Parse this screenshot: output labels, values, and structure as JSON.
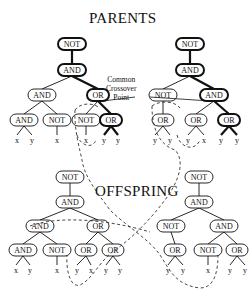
{
  "titles": {
    "parents": "PARENTS",
    "offspring": "OFFSPRING"
  },
  "callout": {
    "line1": "Common",
    "line2": "Crossover",
    "line3": "Point"
  },
  "trees": [
    {
      "name": "parent-left",
      "nodes": [
        {
          "id": "a",
          "label": "NOT",
          "bold": true
        },
        {
          "id": "b",
          "label": "AND",
          "bold": true,
          "parent": "a"
        },
        {
          "id": "c",
          "label": "AND",
          "parent": "b"
        },
        {
          "id": "d",
          "label": "OR",
          "bold": true,
          "parent": "b"
        },
        {
          "id": "e",
          "label": "AND",
          "parent": "c"
        },
        {
          "id": "f",
          "label": "NOT",
          "parent": "c"
        },
        {
          "id": "g",
          "label": "NOT",
          "parent": "d"
        },
        {
          "id": "h",
          "label": "OR",
          "bold": true,
          "parent": "d"
        }
      ],
      "leaves": [
        "x",
        "y",
        "x",
        "x",
        "y",
        "y"
      ]
    },
    {
      "name": "parent-right",
      "nodes": [
        {
          "id": "a",
          "label": "NOT",
          "bold": true
        },
        {
          "id": "b",
          "label": "AND",
          "bold": true,
          "parent": "a"
        },
        {
          "id": "c",
          "label": "NOT",
          "parent": "b"
        },
        {
          "id": "d",
          "label": "AND",
          "bold": true,
          "parent": "b"
        },
        {
          "id": "e",
          "label": "OR",
          "parent": "c"
        },
        {
          "id": "f",
          "label": "OR",
          "parent": "d"
        },
        {
          "id": "g",
          "label": "OR",
          "bold": true,
          "parent": "d"
        }
      ],
      "leaves": [
        "y",
        "y",
        "y",
        "x",
        "y",
        "y"
      ]
    },
    {
      "name": "offspring-left",
      "nodes": [
        {
          "id": "a",
          "label": "NOT"
        },
        {
          "id": "b",
          "label": "AND",
          "parent": "a"
        },
        {
          "id": "c",
          "label": "AND",
          "parent": "b"
        },
        {
          "id": "d",
          "label": "OR",
          "parent": "b"
        },
        {
          "id": "e",
          "label": "AND",
          "parent": "c"
        },
        {
          "id": "f",
          "label": "NOT",
          "parent": "c"
        },
        {
          "id": "g",
          "label": "OR",
          "parent": "d"
        },
        {
          "id": "h",
          "label": "OR",
          "parent": "d"
        }
      ],
      "leaves": [
        "x",
        "y",
        "x",
        "y",
        "x",
        "y",
        "y"
      ]
    },
    {
      "name": "offspring-right",
      "nodes": [
        {
          "id": "a",
          "label": "NOT"
        },
        {
          "id": "b",
          "label": "AND",
          "parent": "a"
        },
        {
          "id": "c",
          "label": "NOT",
          "parent": "b"
        },
        {
          "id": "d",
          "label": "AND",
          "parent": "b"
        },
        {
          "id": "e",
          "label": "OR",
          "parent": "c"
        },
        {
          "id": "f",
          "label": "NOT",
          "parent": "d"
        },
        {
          "id": "g",
          "label": "OR",
          "parent": "d"
        }
      ],
      "leaves": [
        "y",
        "y",
        "x",
        "y",
        "y"
      ]
    }
  ]
}
